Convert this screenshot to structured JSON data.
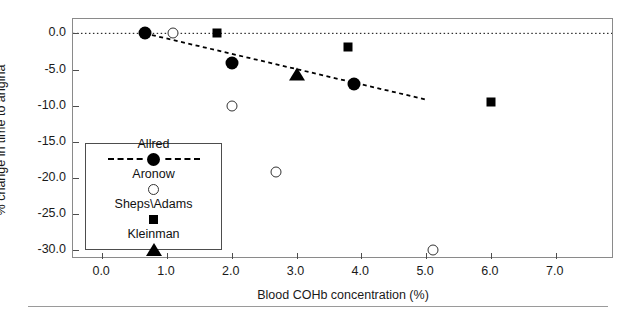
{
  "chart_data": {
    "type": "scatter",
    "title": "",
    "xlabel": "Blood COHb concentration (%)",
    "ylabel": "% change in time to angina",
    "xlim": [
      -0.45,
      7.9
    ],
    "ylim": [
      -31.2,
      2.0
    ],
    "xticks": [
      "0.0",
      "1.0",
      "2.0",
      "3.0",
      "4.0",
      "5.0",
      "6.0",
      "7.0"
    ],
    "xtick_values": [
      0.0,
      1.0,
      2.0,
      3.0,
      4.0,
      5.0,
      6.0,
      7.0
    ],
    "yticks": [
      "0.0",
      "-5.0",
      "-10.0",
      "-15.0",
      "-20.0",
      "-25.0",
      "-30.0"
    ],
    "ytick_values": [
      0.0,
      -5.0,
      -10.0,
      -15.0,
      -20.0,
      -25.0,
      -30.0
    ],
    "grid": false,
    "legend_position": "lower-left-inset",
    "reference_line": {
      "y": 0.0,
      "style": "dotted",
      "color": "#000000"
    },
    "trend_line": {
      "series": "Allred",
      "style": "dashed",
      "color": "#000000",
      "x_start": 0.66,
      "y_start": 0.0,
      "x_end": 5.0,
      "y_end": -9.2
    },
    "series": [
      {
        "name": "Allred",
        "marker": "filled-circle",
        "points": [
          {
            "x": 0.66,
            "y": 0.0
          },
          {
            "x": 2.0,
            "y": -4.1
          },
          {
            "x": 3.88,
            "y": -7.0
          }
        ]
      },
      {
        "name": "Aronow",
        "marker": "open-circle",
        "points": [
          {
            "x": 1.1,
            "y": 0.1
          },
          {
            "x": 2.0,
            "y": -10.1
          },
          {
            "x": 2.68,
            "y": -19.1
          },
          {
            "x": 5.1,
            "y": -29.9
          }
        ]
      },
      {
        "name": "Sheps\\Adams",
        "marker": "square",
        "points": [
          {
            "x": 1.78,
            "y": 0.0
          },
          {
            "x": 3.8,
            "y": -1.9
          },
          {
            "x": 6.0,
            "y": -9.5
          }
        ]
      },
      {
        "name": "Kleinman",
        "marker": "triangle",
        "points": [
          {
            "x": 3.0,
            "y": -5.6
          }
        ]
      }
    ]
  },
  "legend": {
    "entries": [
      {
        "label": "Allred",
        "marker": "filled-circle",
        "has_line": true
      },
      {
        "label": "Aronow",
        "marker": "open-circle",
        "has_line": false
      },
      {
        "label": "Sheps\\Adams",
        "marker": "square",
        "has_line": false
      },
      {
        "label": "Kleinman",
        "marker": "triangle",
        "has_line": false
      }
    ]
  }
}
